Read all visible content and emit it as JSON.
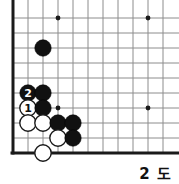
{
  "figure": {
    "caption": "2 도",
    "kind": "go-board-diagram"
  },
  "board": {
    "origin_x": 13,
    "origin_y": 18,
    "spacing": 15,
    "cols": 11,
    "rows": 10,
    "left_edge": true,
    "bottom_edge": true,
    "colors": {
      "grid": "#8c8c8c",
      "edge": "#1a1a1a",
      "black_stone": "#111111",
      "white_stone": "#ffffff",
      "label_on_black": "#ffffff",
      "label_on_white": "#111111",
      "background": "#ffffff"
    },
    "star_points": [
      {
        "col": 4,
        "row": 1
      },
      {
        "col": 10,
        "row": 1
      },
      {
        "col": 4,
        "row": 7
      },
      {
        "col": 10,
        "row": 7
      }
    ],
    "stones": [
      {
        "id": "b-a",
        "color": "black",
        "col": 3,
        "row": 3,
        "label": ""
      },
      {
        "id": "b-move2",
        "color": "black",
        "col": 2,
        "row": 6,
        "label": "2"
      },
      {
        "id": "b-b",
        "color": "black",
        "col": 3,
        "row": 6,
        "label": ""
      },
      {
        "id": "w-move1",
        "color": "white",
        "col": 2,
        "row": 7,
        "label": "1"
      },
      {
        "id": "b-c",
        "color": "black",
        "col": 3,
        "row": 7,
        "label": ""
      },
      {
        "id": "w-a",
        "color": "white",
        "col": 2,
        "row": 8,
        "label": ""
      },
      {
        "id": "w-b",
        "color": "white",
        "col": 3,
        "row": 8,
        "label": ""
      },
      {
        "id": "b-d",
        "color": "black",
        "col": 4,
        "row": 8,
        "label": ""
      },
      {
        "id": "b-e",
        "color": "black",
        "col": 5,
        "row": 8,
        "label": ""
      },
      {
        "id": "w-c",
        "color": "white",
        "col": 4,
        "row": 9,
        "label": ""
      },
      {
        "id": "b-f",
        "color": "black",
        "col": 5,
        "row": 9,
        "label": ""
      },
      {
        "id": "w-d",
        "color": "white",
        "col": 3,
        "row": 10,
        "label": ""
      }
    ]
  }
}
